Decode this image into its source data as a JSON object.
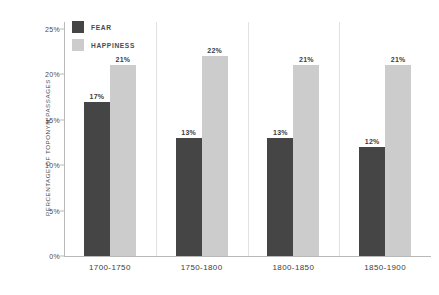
{
  "chart_data": {
    "type": "bar",
    "title": "",
    "xlabel": "",
    "ylabel": "PERCENTAGE OF TOPONYM PASSAGES",
    "categories": [
      "1700-1750",
      "1750-1800",
      "1800-1850",
      "1850-1900"
    ],
    "series": [
      {
        "name": "FEAR",
        "color": "#454545",
        "values": [
          17,
          13,
          13,
          12
        ],
        "labels": [
          "17%",
          "13%",
          "13%",
          "12%"
        ]
      },
      {
        "name": "HAPPINESS",
        "color": "#cccccc",
        "values": [
          21,
          22,
          21,
          21
        ],
        "labels": [
          "21%",
          "22%",
          "21%",
          "21%"
        ]
      }
    ],
    "ylim": [
      0,
      25
    ],
    "yticks": [
      0,
      5,
      10,
      15,
      20,
      25
    ],
    "ytick_labels": [
      "0%",
      "5%",
      "10%",
      "15%",
      "20%",
      "25%"
    ],
    "grid": false,
    "legend_position": "top-left",
    "group_separators": true,
    "axis_color": "#b9b9b9",
    "separator_color": "#e2e2e2",
    "background": "#ffffff"
  },
  "legend": {
    "items": [
      {
        "label": "FEAR",
        "color": "#454545"
      },
      {
        "label": "HAPPINESS",
        "color": "#cccccc"
      }
    ]
  }
}
